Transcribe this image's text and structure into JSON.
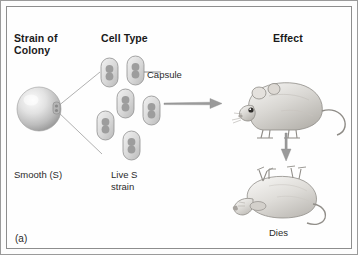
{
  "figure": {
    "panel_label": "(a)",
    "background_color": "#fefefe",
    "border_color": "#8d8d8d",
    "arrow_color": "#8e8e8e",
    "cell_color": "#9a9a9a"
  },
  "headers": {
    "strain_of_colony": "Strain of\nColony",
    "cell_type": "Cell Type",
    "effect": "Effect"
  },
  "labels": {
    "smooth": "Smooth (S)",
    "live_s_strain": "Live S\nstrain",
    "capsule": "Capsule",
    "dies": "Dies"
  },
  "diagram": {
    "colony": {
      "name": "smooth-colony-sphere",
      "type": "glossy-sphere"
    },
    "cells": {
      "count": 6,
      "type": "encapsulated-bacteria"
    },
    "mice": [
      {
        "name": "live-mouse",
        "state": "alive"
      },
      {
        "name": "dead-mouse",
        "state": "dead"
      }
    ],
    "arrows": [
      {
        "name": "injection-arrow",
        "direction": "right"
      },
      {
        "name": "outcome-arrow",
        "direction": "down"
      }
    ]
  }
}
